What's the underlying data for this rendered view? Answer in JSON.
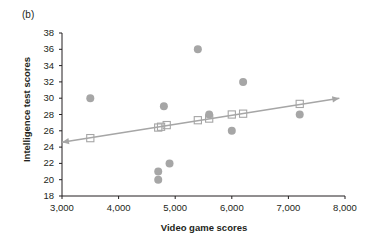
{
  "panel": {
    "label": "(b)"
  },
  "chart_data": {
    "type": "scatter",
    "title": "",
    "panel_label": "(b)",
    "xlabel": "Video game scores",
    "ylabel": "Intelligence test scores",
    "xlim": [
      3000,
      8000
    ],
    "ylim": [
      18,
      38
    ],
    "xticks": [
      3000,
      4000,
      5000,
      6000,
      7000,
      8000
    ],
    "xtick_labels": [
      "3,000",
      "4,000",
      "5,000",
      "6,000",
      "7,000",
      "8,000"
    ],
    "yticks": [
      18,
      20,
      22,
      24,
      26,
      28,
      30,
      32,
      34,
      36,
      38
    ],
    "ytick_labels": [
      "18",
      "20",
      "22",
      "24",
      "26",
      "28",
      "30",
      "32",
      "34",
      "36",
      "38"
    ],
    "grid": false,
    "legend": "none",
    "series": [
      {
        "name": "Observed scores",
        "marker": "filled-circle",
        "color": "#a6a6a6",
        "points": [
          {
            "x": 3500,
            "y": 30.0
          },
          {
            "x": 4700,
            "y": 21.0
          },
          {
            "x": 4700,
            "y": 20.0
          },
          {
            "x": 4800,
            "y": 29.0
          },
          {
            "x": 4900,
            "y": 22.0
          },
          {
            "x": 5400,
            "y": 36.0
          },
          {
            "x": 5600,
            "y": 28.0
          },
          {
            "x": 6000,
            "y": 26.0
          },
          {
            "x": 6200,
            "y": 32.0
          },
          {
            "x": 7200,
            "y": 28.0
          }
        ]
      },
      {
        "name": "Predicted scores",
        "marker": "open-square",
        "color": "#a6a6a6",
        "points": [
          {
            "x": 3500,
            "y": 25.1
          },
          {
            "x": 4700,
            "y": 26.4
          },
          {
            "x": 4750,
            "y": 26.5
          },
          {
            "x": 4850,
            "y": 26.7
          },
          {
            "x": 5400,
            "y": 27.3
          },
          {
            "x": 5600,
            "y": 27.5
          },
          {
            "x": 6000,
            "y": 28.0
          },
          {
            "x": 6200,
            "y": 28.1
          },
          {
            "x": 7200,
            "y": 29.3
          }
        ]
      }
    ],
    "trend_line": {
      "name": "Regression line",
      "color": "#a6a6a6",
      "x_start": 3000,
      "y_start": 24.6,
      "x_end": 7900,
      "y_end": 30.0,
      "arrow_start": true,
      "arrow_end": true
    }
  }
}
